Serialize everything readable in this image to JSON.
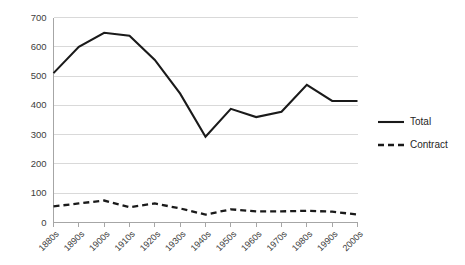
{
  "chart_data": {
    "type": "line",
    "title": "",
    "xlabel": "",
    "ylabel": "",
    "ylim": [
      0,
      700
    ],
    "ytick_values": [
      0,
      100,
      200,
      300,
      400,
      500,
      600,
      700
    ],
    "ytick_labels": [
      "0",
      "100",
      "200",
      "300",
      "400",
      "500",
      "600",
      "700"
    ],
    "grid": true,
    "legend_position": "right",
    "categories": [
      "1880s",
      "1890s",
      "1900s",
      "1910s",
      "1920s",
      "1930s",
      "1940s",
      "1950s",
      "1960s",
      "1970s",
      "1980s",
      "1990s",
      "2000s"
    ],
    "series": [
      {
        "name": "Total",
        "style": "solid",
        "color": "#1a1a1a",
        "values": [
          510,
          600,
          648,
          638,
          555,
          440,
          293,
          388,
          360,
          378,
          470,
          415,
          415
        ]
      },
      {
        "name": "Contract",
        "style": "dashed",
        "color": "#1a1a1a",
        "values": [
          55,
          65,
          75,
          52,
          65,
          48,
          27,
          45,
          38,
          38,
          40,
          37,
          27
        ]
      }
    ]
  },
  "legend": {
    "items": [
      {
        "label": "Total",
        "style": "solid"
      },
      {
        "label": "Contract",
        "style": "dashed"
      }
    ]
  },
  "colors": {
    "line": "#1a1a1a",
    "grid": "#d9d9d9",
    "axis": "#a6a6a6",
    "text": "#404040",
    "background": "#ffffff"
  }
}
